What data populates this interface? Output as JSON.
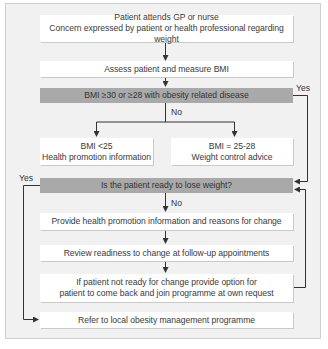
{
  "flowchart": {
    "nodes": {
      "start": {
        "line1": "Patient attends GP or nurse",
        "line2": "Concern expressed by patient or health professional regarding weight"
      },
      "assess": {
        "text": "Assess patient and measure BMI"
      },
      "decision_bmi": {
        "text": "BMI ≥30 or ≥28 with obesity related disease"
      },
      "bmi_low": {
        "line1": "BMI <25",
        "line2": "Health promotion information"
      },
      "bmi_mid": {
        "line1": "BMI = 25-28",
        "line2": "Weight control advice"
      },
      "decision_ready": {
        "text": "Is the patient ready to lose weight?"
      },
      "provide_info": {
        "text": "Provide health promotion information and reasons for change"
      },
      "review": {
        "text": "Review readiness to change at follow-up appointments"
      },
      "not_ready": {
        "line1": "If patient not ready for change provide option for",
        "line2": "patient to come back and join programme at own request"
      },
      "refer": {
        "text": "Refer to local obesity management programme"
      }
    },
    "edge_labels": {
      "bmi_yes": "Yes",
      "bmi_no": "No",
      "ready_yes": "Yes",
      "ready_no": "No"
    },
    "colors": {
      "frame_bg": "#f1f1f1",
      "box_bg": "#ffffff",
      "decision_bg": "#a9a9a9",
      "line": "#333333"
    }
  }
}
